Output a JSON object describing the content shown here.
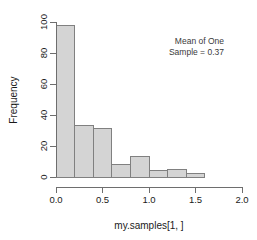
{
  "chart_data": {
    "type": "bar",
    "title": "",
    "xlabel": "my.samples[1, ]",
    "ylabel": "Frequency",
    "xlim": [
      0.0,
      2.0
    ],
    "ylim": [
      0,
      100
    ],
    "grid": false,
    "legend": null,
    "bin_width": 0.2,
    "bin_edges": [
      0.0,
      0.2,
      0.4,
      0.6,
      0.8,
      1.0,
      1.2,
      1.4,
      1.6,
      1.8,
      2.0
    ],
    "categories": [
      "0.0-0.2",
      "0.2-0.4",
      "0.4-0.6",
      "0.6-0.8",
      "0.8-1.0",
      "1.0-1.2",
      "1.2-1.4",
      "1.4-1.6",
      "1.6-1.8",
      "1.8-2.0"
    ],
    "values": [
      98,
      33,
      31,
      8,
      13,
      4,
      5,
      2,
      0,
      0
    ],
    "xticks": [
      0.0,
      0.5,
      1.0,
      1.5,
      2.0
    ],
    "xtick_labels": [
      "0.0",
      "0.5",
      "1.0",
      "1.5",
      "2.0"
    ],
    "yticks": [
      0,
      20,
      40,
      60,
      80,
      100
    ],
    "ytick_labels": [
      "0",
      "20",
      "40",
      "60",
      "80",
      "100"
    ],
    "bar_fill_color": "#d4d4d4",
    "bar_border_color": "#808080",
    "annotations": [
      {
        "line1": "Mean of One",
        "line2": "Sample = 0.37",
        "x": 1.45,
        "y": 88
      }
    ]
  },
  "annotation": {
    "line1": "Mean of One",
    "line2": "Sample = 0.37"
  },
  "axes": {
    "y_title": "Frequency",
    "x_title": "my.samples[1, ]",
    "ytick_0": "0",
    "ytick_1": "20",
    "ytick_2": "40",
    "ytick_3": "60",
    "ytick_4": "80",
    "ytick_5": "100",
    "xtick_0": "0.0",
    "xtick_1": "0.5",
    "xtick_2": "1.0",
    "xtick_3": "1.5",
    "xtick_4": "2.0"
  }
}
